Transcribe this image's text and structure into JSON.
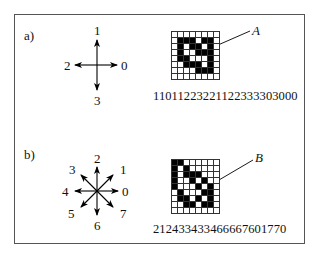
{
  "panels": [
    {
      "label": "a)",
      "directions": [
        "0",
        "1",
        "2",
        "3"
      ],
      "shape_name": "A",
      "chain_code": "11011223221122333303000",
      "grid": [
        "00000000",
        "01110110",
        "01011010",
        "01001110",
        "01100010",
        "00111010",
        "00001110",
        "00000000"
      ]
    },
    {
      "label": "b)",
      "directions": [
        "0",
        "1",
        "2",
        "3",
        "4",
        "5",
        "6",
        "7"
      ],
      "shape_name": "B",
      "chain_code": "212433433466667601770",
      "grid": [
        "11000000",
        "10100000",
        "10111000",
        "10010100",
        "10001010",
        "01000110",
        "01101010",
        "00110110",
        "00000000"
      ]
    }
  ]
}
